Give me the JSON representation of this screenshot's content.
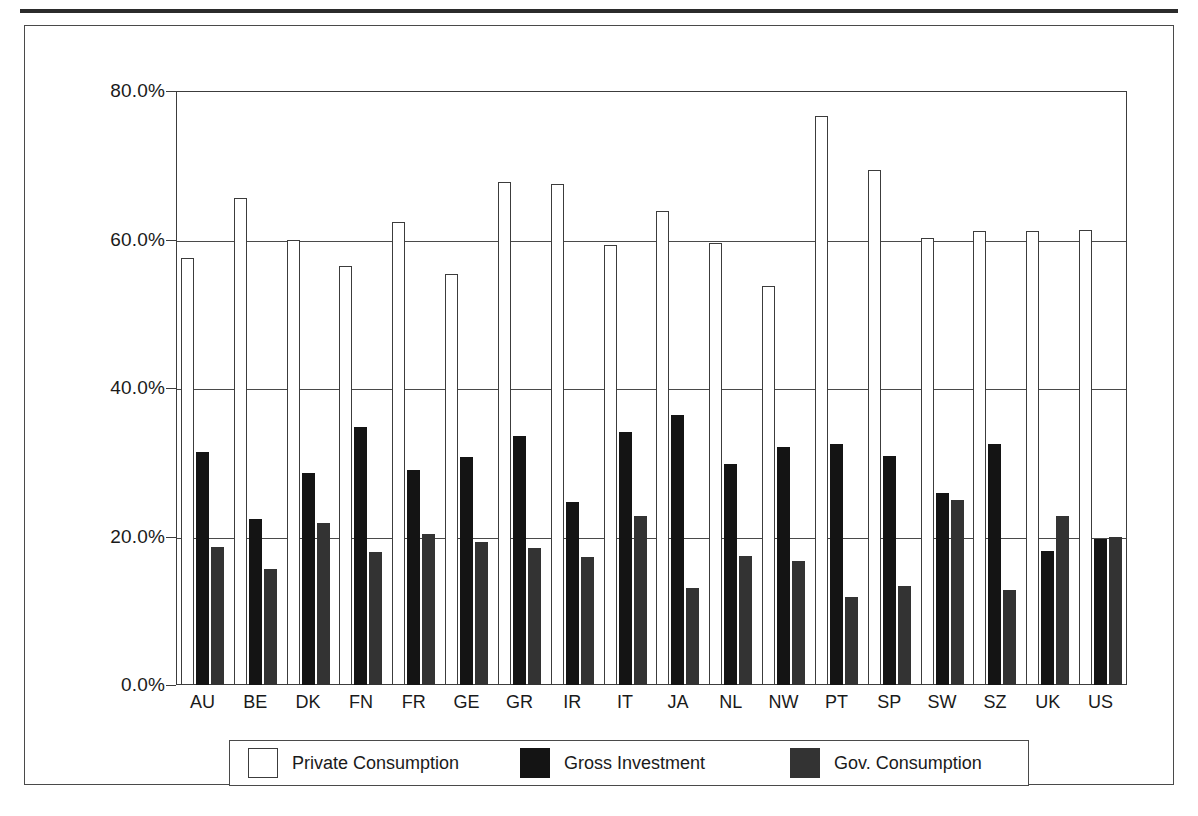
{
  "figure": {
    "frame_color": "#4a4a4a",
    "top_rule_color": "#2b2b2b"
  },
  "chart_data": {
    "type": "bar",
    "title": "",
    "subtitle": "",
    "xlabel": "",
    "ylabel": "",
    "ylim": [
      0,
      80
    ],
    "ytick_labels": [
      "0.0%",
      "20.0%",
      "40.0%",
      "60.0%",
      "80.0%"
    ],
    "ytick_values": [
      0,
      20,
      40,
      60,
      80
    ],
    "grid": true,
    "legend_position": "bottom",
    "categories": [
      "AU",
      "BE",
      "DK",
      "FN",
      "FR",
      "GE",
      "GR",
      "IR",
      "IT",
      "JA",
      "NL",
      "NW",
      "PT",
      "SP",
      "SW",
      "SZ",
      "UK",
      "US"
    ],
    "series": [
      {
        "name": "Private Consumption",
        "color": "#ffffff",
        "values": [
          57.5,
          65.6,
          60.0,
          56.4,
          62.3,
          55.4,
          67.8,
          67.5,
          59.2,
          63.8,
          59.5,
          53.7,
          76.6,
          69.3,
          60.2,
          61.2,
          61.1,
          61.3
        ]
      },
      {
        "name": "Gross Investment",
        "color": "#141414",
        "values": [
          31.4,
          22.4,
          28.5,
          34.7,
          28.9,
          30.7,
          33.5,
          24.7,
          34.1,
          36.3,
          29.8,
          32.1,
          32.4,
          30.9,
          25.9,
          32.5,
          18.0,
          19.6
        ]
      },
      {
        "name": "Gov. Consumption",
        "color": "#333333",
        "values": [
          18.6,
          15.6,
          21.8,
          17.9,
          20.3,
          19.2,
          18.5,
          17.2,
          22.7,
          13.0,
          17.4,
          16.7,
          11.8,
          13.3,
          24.9,
          12.8,
          22.8,
          19.9
        ]
      }
    ],
    "legend_entries": [
      "Private Consumption",
      "Gross Investment",
      "Gov. Consumption"
    ]
  }
}
